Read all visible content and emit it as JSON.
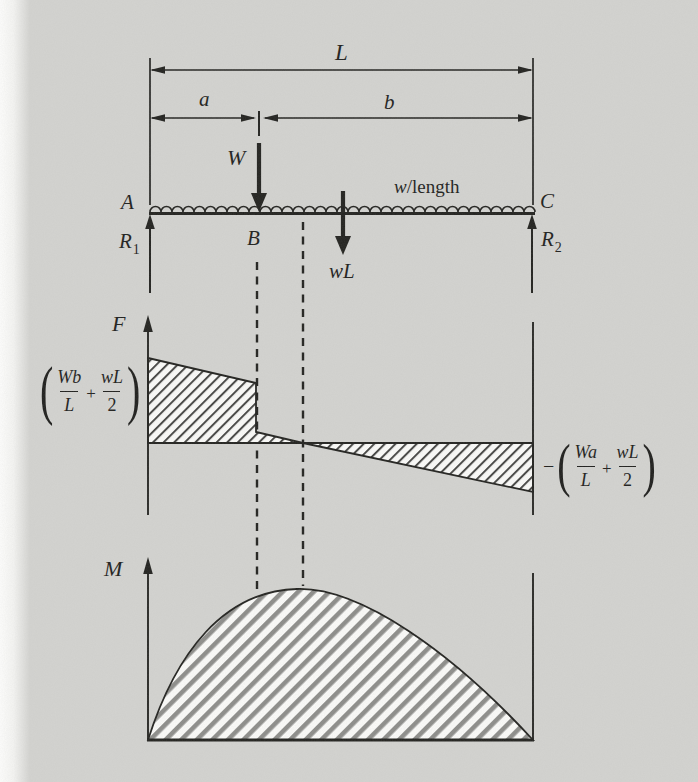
{
  "figure": {
    "beam": {
      "length_label": "L",
      "a_label": "a",
      "b_label": "b",
      "point_load_label": "W",
      "distributed_load_w": "w",
      "distributed_load_rest": "/length",
      "total_distributed_label": "wL",
      "support_left": "A",
      "load_point": "B",
      "support_right": "C",
      "reaction_symbol": "R",
      "reaction_left_sub": "1",
      "reaction_right_sub": "2"
    },
    "shear": {
      "axis_label": "F",
      "left_expr": {
        "open_paren": "(",
        "num1": "Wb",
        "den1": "L",
        "plus": "+",
        "num2": "wL",
        "den2": "2",
        "close_paren": ")"
      },
      "right_expr": {
        "minus": "−",
        "open_paren": "(",
        "num1": "Wa",
        "den1": "L",
        "plus": "+",
        "num2": "wL",
        "den2": "2",
        "close_paren": ")"
      }
    },
    "moment": {
      "axis_label": "M"
    }
  },
  "colors": {
    "paper": "#d3d3d0",
    "ink": "#22221f",
    "hatch_fine": "#454543",
    "hatch_wide": "#8d8d8a",
    "hatch_background": "#fbfbf9"
  }
}
